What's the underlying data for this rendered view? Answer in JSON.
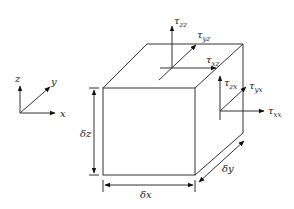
{
  "diagram": {
    "axes": {
      "x_label": "x",
      "y_label": "y",
      "z_label": "z"
    },
    "dimensions": {
      "dx": "δx",
      "dy": "δy",
      "dz": "δz"
    },
    "stresses": {
      "top_face": {
        "normal": {
          "symbol": "τ",
          "sub": "zz"
        },
        "shear_y": {
          "symbol": "τ",
          "sub": "yz"
        },
        "shear_x": {
          "symbol": "τ",
          "sub": "xz"
        }
      },
      "right_face": {
        "shear_z": {
          "symbol": "τ",
          "sub": "zx"
        },
        "shear_y": {
          "symbol": "τ",
          "sub": "yx"
        },
        "normal": {
          "symbol": "τ",
          "sub": "xx"
        }
      }
    },
    "colors": {
      "line": "#333333",
      "background": "#ffffff"
    }
  }
}
